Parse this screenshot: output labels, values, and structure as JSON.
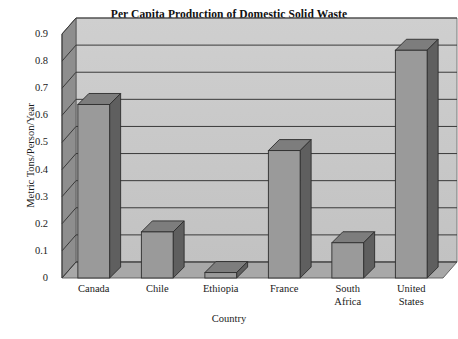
{
  "chart_data": {
    "type": "bar",
    "title": "Per Capita Production of Domestic Solid Waste",
    "xlabel": "Country",
    "ylabel": "Metric Tons/Person/Year",
    "categories": [
      "Canada",
      "Chile",
      "Ethiopia",
      "France",
      "South Africa",
      "United States"
    ],
    "category_lines": [
      [
        "Canada"
      ],
      [
        "Chile"
      ],
      [
        "Ethiopia"
      ],
      [
        "France"
      ],
      [
        "South",
        "Africa"
      ],
      [
        "United",
        "States"
      ]
    ],
    "values": [
      0.64,
      0.17,
      0.02,
      0.47,
      0.13,
      0.84
    ],
    "ylim": [
      0,
      0.9
    ],
    "yticks": [
      0.9,
      0.8,
      0.7,
      0.6,
      0.5,
      0.4,
      0.3,
      0.2,
      0.1,
      0
    ],
    "ytick_labels": [
      "0.9",
      "0.8",
      "0.7",
      "0.6",
      "0.5",
      "0.4",
      "0.3",
      "0.2",
      "0.1",
      "0"
    ],
    "grid": true,
    "legend": false,
    "style": "3d-column",
    "colors": {
      "bar_front": "#9a9a9a",
      "bar_side": "#5f5f5f",
      "bar_top": "#7d7d7d",
      "back_wall": "#c8c8c8",
      "left_wall": "#8e8e8e",
      "floor": "#a8a8a8",
      "gridline": "#3a3a3a",
      "text": "#1a1a1a",
      "page_background": "#ffffff"
    }
  },
  "axis": {
    "y_label_text": "Metric Tons/Person/Year",
    "x_label_text": "Country"
  }
}
